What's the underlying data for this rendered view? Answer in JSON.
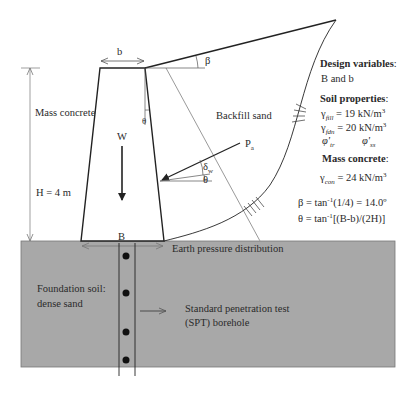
{
  "diagram": {
    "type": "retaining-wall-schematic",
    "labels": {
      "b": "b",
      "beta": "β",
      "mass_concrete": "Mass concrete",
      "height": "H = 4 m",
      "weight": "W",
      "theta_wall": "θ",
      "backfill": "Backfill sand",
      "pa": "P",
      "pa_sub": "a",
      "delta_w": "δ",
      "delta_w_sub": "w",
      "theta": "θ",
      "B": "B",
      "earth_pressure": "Earth pressure distribution",
      "foundation_line1": "Foundation soil:",
      "foundation_line2": "dense sand",
      "spt_line1": "Standard penetration test",
      "spt_line2": "(SPT) borehole"
    },
    "panel": {
      "design_variables_title": "Design variables",
      "design_variables_colon": ":",
      "design_variables_value": "B and b",
      "soil_properties_title": "Soil properties",
      "soil_properties_colon": ":",
      "gamma_fill_sym": "γ",
      "gamma_fill_sub": "fill",
      "gamma_fill_value": " = 19 kN/m",
      "gamma_fill_sup": "3",
      "gamma_fdn_sym": "γ",
      "gamma_fdn_sub": "fdn",
      "gamma_fdn_value": " = 20 kN/m",
      "gamma_fdn_sup": "3",
      "phi_tr_sym": "φ'",
      "phi_tr_sub": "tr",
      "phi_ss_sym": "φ'",
      "phi_ss_sub": "ss",
      "mass_concrete_title": "Mass concrete",
      "mass_concrete_colon": ":",
      "gamma_con_sym": "γ",
      "gamma_con_sub": "con",
      "gamma_con_value": " = 24 kN/m",
      "gamma_con_sup": "3",
      "beta_eq_pre": "β = tan",
      "beta_eq_sup": "-1",
      "beta_eq_post": "(1/4) = 14.0º",
      "theta_eq_pre": "θ = tan",
      "theta_eq_sup": "-1",
      "theta_eq_post": "[(B-b)/(2H)]"
    },
    "colors": {
      "ground_fill": "#a8a8a8",
      "line": "#222222",
      "failure_line": "#9a9a9a"
    }
  }
}
